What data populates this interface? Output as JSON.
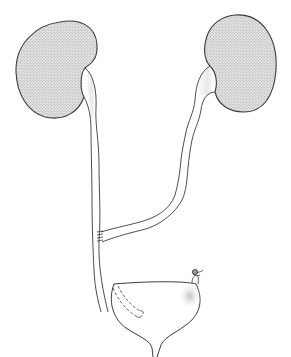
{
  "diagram": {
    "colors": {
      "line": "#3a3a3a",
      "fill_stipple": "#cfcfcf",
      "background": "#ffffff"
    },
    "parts": [
      {
        "id": "left-kidney",
        "label": ""
      },
      {
        "id": "right-kidney",
        "label": ""
      },
      {
        "id": "left-ureter",
        "label": ""
      },
      {
        "id": "right-ureter",
        "label": ""
      },
      {
        "id": "ureteroureterostomy-anastomosis",
        "label": ""
      },
      {
        "id": "bladder",
        "label": ""
      },
      {
        "id": "ligated-ureter-stump",
        "label": ""
      },
      {
        "id": "intramural-ureter-dashed",
        "label": ""
      }
    ]
  }
}
